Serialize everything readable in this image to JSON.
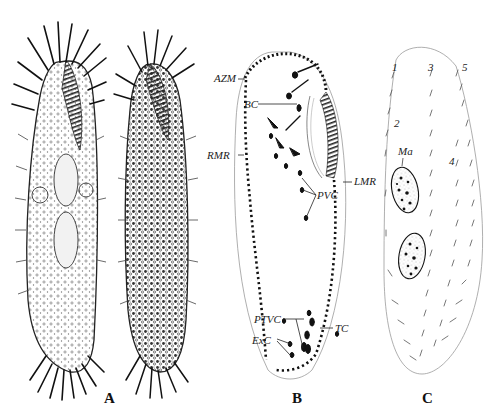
{
  "figure": {
    "panels": [
      {
        "id": "A",
        "label": "A",
        "description": "Two habitus drawings of a hypotrich ciliate (ventral and dorsal view) with long marginal cirri"
      },
      {
        "id": "B",
        "label": "B",
        "description": "Infraciliature of ventral side"
      },
      {
        "id": "C",
        "label": "C",
        "description": "Dorsal kineties and macronuclei"
      }
    ],
    "panel_b_labels": {
      "azm": "AZM",
      "bc": "BC",
      "rmr": "RMR",
      "lmr": "LMR",
      "pvc": "PVC",
      "ptvc": "PTVC",
      "exc": "ExC",
      "tc": "TC"
    },
    "panel_c_labels": {
      "k1": "1",
      "k2": "2",
      "k3": "3",
      "k4": "4",
      "k5": "5",
      "ma": "Ma"
    },
    "colors": {
      "ink": "#111111",
      "outline": "#9a9a9a",
      "stipple": "#d8d8d8"
    }
  }
}
